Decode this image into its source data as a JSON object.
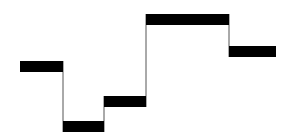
{
  "diagram": {
    "type": "step-levels",
    "colors": {
      "background": "#ffffff",
      "bar": "#000000",
      "connector": "#555555"
    },
    "bars": [
      {
        "x1": 20,
        "x2": 63,
        "y": 61,
        "h": 11
      },
      {
        "x1": 63,
        "x2": 104,
        "y": 121,
        "h": 11
      },
      {
        "x1": 104,
        "x2": 146,
        "y": 96,
        "h": 11
      },
      {
        "x1": 146,
        "x2": 229,
        "y": 14,
        "h": 11
      },
      {
        "x1": 229,
        "x2": 276,
        "y": 46,
        "h": 11
      }
    ],
    "connectors": [
      {
        "x": 63,
        "y1": 61,
        "y2": 132
      },
      {
        "x": 104,
        "y1": 96,
        "y2": 132
      },
      {
        "x": 146,
        "y1": 14,
        "y2": 107
      },
      {
        "x": 229,
        "y1": 14,
        "y2": 57
      }
    ]
  }
}
